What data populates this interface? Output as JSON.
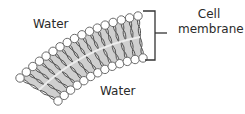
{
  "diagram": {
    "labels": {
      "water_top": "Water",
      "water_bottom": "Water",
      "cell_membrane_line1": "Cell",
      "cell_membrane_line2": "membrane"
    },
    "colors": {
      "head_fill": "#ffffff",
      "head_stroke": "#6a6a6a",
      "tail_stroke": "#555555",
      "band_fill": "#cfcfcf",
      "midline": "#eeeeee",
      "bracket": "#333333",
      "text": "#2a2a2a"
    },
    "bilayer": {
      "outer_head_count": 17,
      "inner_head_count": 13,
      "head_radius": 4.2
    }
  }
}
